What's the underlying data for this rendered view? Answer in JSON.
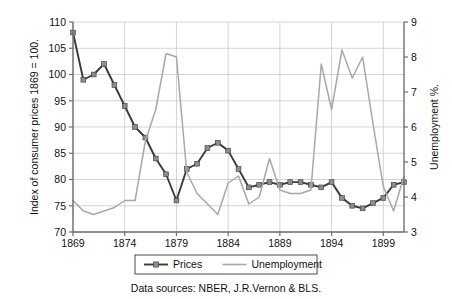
{
  "chart_data": {
    "type": "line",
    "title": "",
    "xlabel": "",
    "ylabel": "Index of consumer prices 1869 = 100.",
    "y2label": "Unemployment %.",
    "xlim": [
      1869,
      1901
    ],
    "ylim": [
      70,
      110
    ],
    "y2lim": [
      3,
      9
    ],
    "grid": true,
    "legend_position": "bottom",
    "x_ticks": [
      "1869",
      "1874",
      "1879",
      "1884",
      "1889",
      "1894",
      "1899"
    ],
    "x_tick_values": [
      1869,
      1874,
      1879,
      1884,
      1889,
      1894,
      1899
    ],
    "y_ticks": [
      "70",
      "75",
      "80",
      "85",
      "90",
      "95",
      "100",
      "105",
      "110"
    ],
    "y_tick_values": [
      70,
      75,
      80,
      85,
      90,
      95,
      100,
      105,
      110
    ],
    "y2_ticks": [
      "3",
      "4",
      "5",
      "6",
      "7",
      "8",
      "9"
    ],
    "y2_tick_values": [
      3,
      4,
      5,
      6,
      7,
      8,
      9
    ],
    "source_note": "Data sources: NBER, J.R.Vernon & BLS.",
    "series": [
      {
        "name": "Prices",
        "axis": "left",
        "color": "#3a3a3a",
        "marker": "square",
        "marker_color": "#8c8c8c",
        "x": [
          1869,
          1870,
          1871,
          1872,
          1873,
          1874,
          1875,
          1876,
          1877,
          1878,
          1879,
          1880,
          1881,
          1882,
          1883,
          1884,
          1885,
          1886,
          1887,
          1888,
          1889,
          1890,
          1891,
          1892,
          1893,
          1894,
          1895,
          1896,
          1897,
          1898,
          1899,
          1900,
          1901
        ],
        "values": [
          108.0,
          99.0,
          100.0,
          102.0,
          98.0,
          94.0,
          90.0,
          88.0,
          84.0,
          81.0,
          76.0,
          82.0,
          83.0,
          86.0,
          87.0,
          85.5,
          82.0,
          78.5,
          79.0,
          79.5,
          79.0,
          79.5,
          79.5,
          79.0,
          78.5,
          79.5,
          76.5,
          75.0,
          74.5,
          75.5,
          76.5,
          79.0,
          79.5
        ]
      },
      {
        "name": "Unemployment",
        "axis": "right",
        "color": "#a8a8a8",
        "marker": "none",
        "x": [
          1869,
          1870,
          1871,
          1872,
          1873,
          1874,
          1875,
          1876,
          1877,
          1878,
          1879,
          1880,
          1881,
          1882,
          1883,
          1884,
          1885,
          1886,
          1887,
          1888,
          1889,
          1890,
          1891,
          1892,
          1893,
          1894,
          1895,
          1896,
          1897,
          1898,
          1899,
          1900,
          1901
        ],
        "values": [
          3.9,
          3.6,
          3.5,
          3.6,
          3.7,
          3.9,
          3.9,
          5.6,
          6.5,
          8.1,
          8.0,
          4.7,
          4.1,
          3.8,
          3.5,
          4.4,
          4.6,
          3.8,
          4.0,
          5.1,
          4.2,
          4.1,
          4.1,
          4.2,
          7.8,
          6.5,
          8.2,
          7.4,
          8.0,
          6.1,
          4.3,
          3.6,
          4.6
        ]
      }
    ]
  },
  "legend": {
    "items": [
      {
        "label": "Prices",
        "color": "#3a3a3a",
        "marker": "square"
      },
      {
        "label": "Unemployment",
        "color": "#a8a8a8",
        "marker": "none"
      }
    ]
  }
}
